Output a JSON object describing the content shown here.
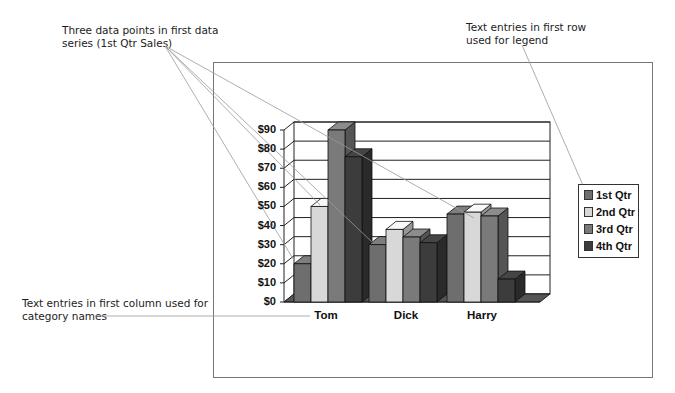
{
  "callouts": {
    "series_points": [
      "Three data points in first data",
      "series (1st Qtr Sales)"
    ],
    "legend_row": [
      "Text entries in first row",
      "used for legend"
    ],
    "category_column": [
      "Text entries in first column used for",
      "category names"
    ]
  },
  "legend": {
    "items": [
      {
        "label": "1st Qtr",
        "color": "#6e6e6e"
      },
      {
        "label": "2nd Qtr",
        "color": "#d8d8d8"
      },
      {
        "label": "3rd Qtr",
        "color": "#7a7a7a"
      },
      {
        "label": "4th Qtr",
        "color": "#3c3c3c"
      }
    ]
  },
  "axis": {
    "y_ticks": [
      "$0",
      "$10",
      "$20",
      "$30",
      "$40",
      "$50",
      "$60",
      "$70",
      "$80",
      "$90"
    ],
    "categories": [
      "Tom",
      "Dick",
      "Harry"
    ]
  },
  "chart_data": {
    "type": "bar",
    "title": "",
    "xlabel": "",
    "ylabel": "",
    "categories": [
      "Tom",
      "Dick",
      "Harry"
    ],
    "series": [
      {
        "name": "1st Qtr",
        "values": [
          20,
          30,
          46
        ]
      },
      {
        "name": "2nd Qtr",
        "values": [
          50,
          38,
          47
        ]
      },
      {
        "name": "3rd Qtr",
        "values": [
          90,
          34,
          45
        ]
      },
      {
        "name": "4th Qtr",
        "values": [
          76,
          31,
          12
        ]
      }
    ],
    "ylim": [
      0,
      90
    ],
    "y_tick_labels": [
      "$0",
      "$10",
      "$20",
      "$30",
      "$40",
      "$50",
      "$60",
      "$70",
      "$80",
      "$90"
    ],
    "grid": true,
    "legend_position": "right",
    "style": "3d clustered column"
  }
}
